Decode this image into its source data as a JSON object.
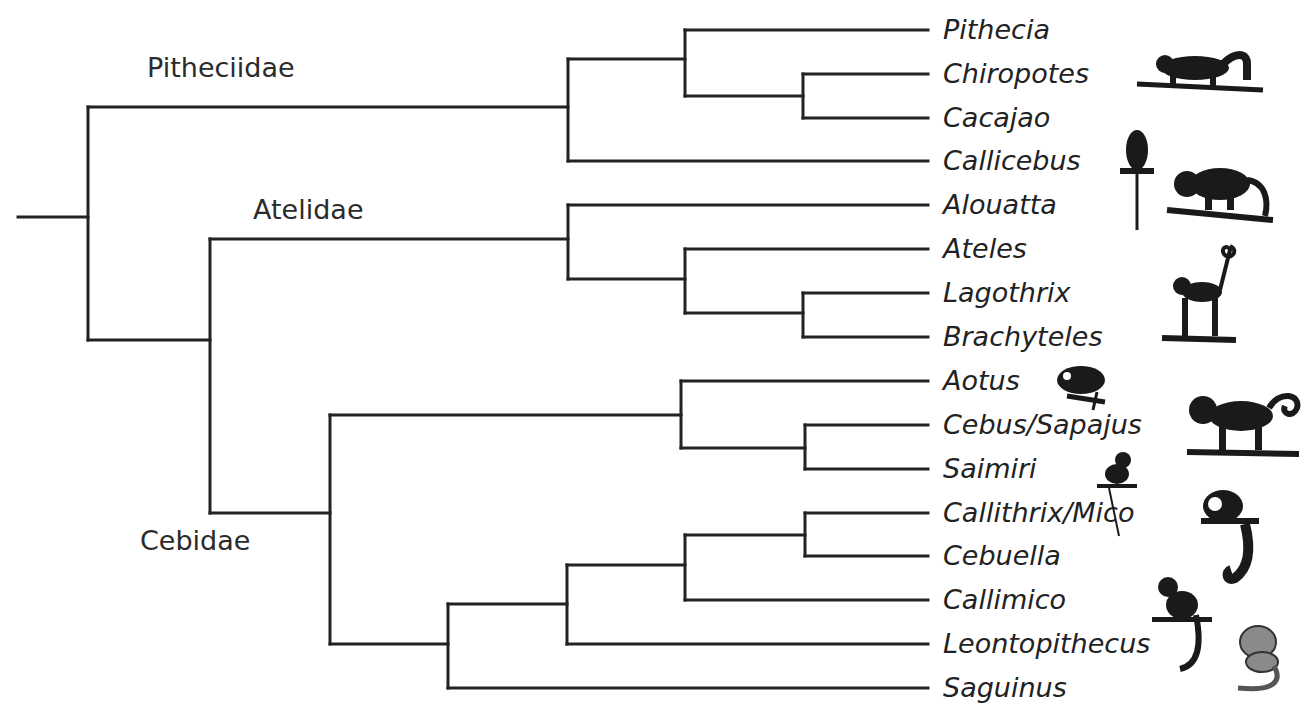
{
  "diagram": {
    "type": "phylogenetic-tree",
    "line_color": "#222222",
    "families": [
      {
        "id": "pitheciidae",
        "label": "Pitheciidae",
        "x": 147,
        "y": 52
      },
      {
        "id": "atelidae",
        "label": "Atelidae",
        "x": 253,
        "y": 195
      },
      {
        "id": "cebidae",
        "label": "Cebidae",
        "x": 140,
        "y": 525
      }
    ],
    "taxa": [
      {
        "id": "pithecia",
        "label": "Pithecia",
        "y": 30
      },
      {
        "id": "chiropotes",
        "label": "Chiropotes",
        "y": 74
      },
      {
        "id": "cacajao",
        "label": "Cacajao",
        "y": 118
      },
      {
        "id": "callicebus",
        "label": "Callicebus",
        "y": 161
      },
      {
        "id": "alouatta",
        "label": "Alouatta",
        "y": 205
      },
      {
        "id": "ateles",
        "label": "Ateles",
        "y": 249
      },
      {
        "id": "lagothrix",
        "label": "Lagothrix",
        "y": 293
      },
      {
        "id": "brachyteles",
        "label": "Brachyteles",
        "y": 337
      },
      {
        "id": "aotus",
        "label": "Aotus",
        "y": 381
      },
      {
        "id": "cebus-sapajus",
        "label": "Cebus/Sapajus",
        "y": 425
      },
      {
        "id": "saimiri",
        "label": "Saimiri",
        "y": 469
      },
      {
        "id": "callithrix-mico",
        "label": "Callithrix/Mico",
        "y": 513
      },
      {
        "id": "cebuella",
        "label": "Cebuella",
        "y": 556
      },
      {
        "id": "callimico",
        "label": "Callimico",
        "y": 600
      },
      {
        "id": "leontopithecus",
        "label": "Leontopithecus",
        "y": 644
      },
      {
        "id": "saguinus",
        "label": "Saguinus",
        "y": 688
      }
    ],
    "topology": "((Pithecia,(Chiropotes,Cacajao)),Callicebus)Pitheciidae,((Alouatta,(Ateles,(Lagothrix,Brachyteles)))Atelidae,((Aotus,(Cebus/Sapajus,Saimiri)),(((Callithrix/Mico,Cebuella),Callimico),Leontopithecus),Saguinus))Cebidae)",
    "illustrations": [
      "pithecia-monkey-icon",
      "callicebus-monkey-icon",
      "alouatta-monkey-icon",
      "ateles-monkey-icon",
      "aotus-monkey-icon",
      "cebus-monkey-icon",
      "saimiri-monkey-icon",
      "callithrix-monkey-icon",
      "callimico-monkey-icon",
      "leontopithecus-monkey-icon"
    ]
  }
}
